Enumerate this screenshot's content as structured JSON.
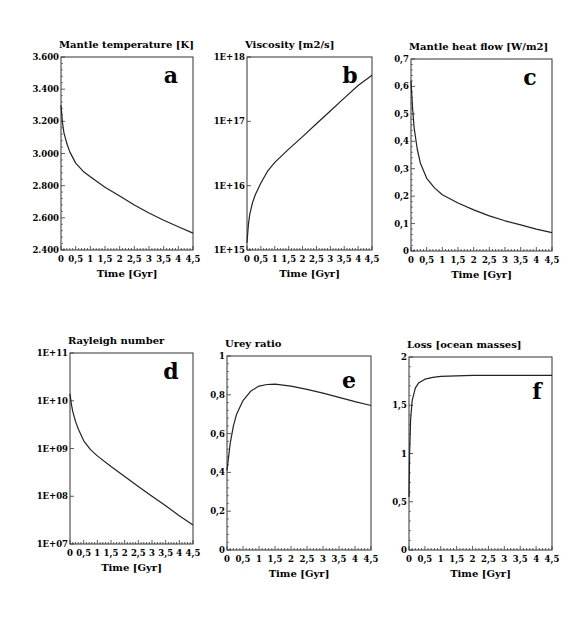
{
  "figure": {
    "x_axis_label": "Time [Gyr]",
    "x_tick_labels": [
      "0",
      "0,5",
      "1",
      "1,5",
      "2",
      "2,5",
      "3",
      "3,5",
      "4",
      "4,5"
    ]
  },
  "chart_data": [
    {
      "id": "a",
      "type": "line",
      "title": "Mantle temperature [K]",
      "panel_label": "a",
      "xlabel": "Time [Gyr]",
      "ylabel": "Mantle temperature [K]",
      "xlim": [
        0,
        4.5
      ],
      "ylim": [
        2400,
        3600
      ],
      "yscale": "linear",
      "y_tick_values": [
        2400,
        2600,
        2800,
        3000,
        3200,
        3400,
        3600
      ],
      "y_tick_labels": [
        "2.400",
        "2.600",
        "2.800",
        "3.000",
        "3.200",
        "3.400",
        "3.600"
      ],
      "grid": false,
      "frame": {
        "left": 61,
        "top": 57,
        "right": 193,
        "bottom": 250
      },
      "x": [
        0,
        0.05,
        0.1,
        0.2,
        0.3,
        0.5,
        0.75,
        1.0,
        1.5,
        2.0,
        2.5,
        3.0,
        3.5,
        4.0,
        4.5
      ],
      "y": [
        3300,
        3190,
        3130,
        3060,
        3010,
        2940,
        2890,
        2855,
        2790,
        2735,
        2680,
        2630,
        2585,
        2545,
        2505
      ]
    },
    {
      "id": "b",
      "type": "line",
      "title": "Viscosity [m2/s]",
      "panel_label": "b",
      "xlabel": "Time [Gyr]",
      "ylabel": "Viscosity [m2/s]",
      "xlim": [
        0,
        4.5
      ],
      "ylim": [
        1000000000000000.0,
        1e+18
      ],
      "yscale": "log",
      "y_tick_values": [
        1000000000000000.0,
        1e+16,
        1e+17,
        1e+18
      ],
      "y_tick_labels": [
        "1E+15",
        "1E+16",
        "1E+17",
        "1E+18"
      ],
      "grid": false,
      "frame": {
        "left": 247,
        "top": 57,
        "right": 372,
        "bottom": 250
      },
      "x": [
        0,
        0.05,
        0.1,
        0.2,
        0.3,
        0.5,
        0.75,
        1.0,
        1.5,
        2.0,
        2.5,
        3.0,
        3.5,
        4.0,
        4.5
      ],
      "y": [
        1300000000000000.0,
        2500000000000000.0,
        3600000000000000.0,
        5500000000000000.0,
        7200000000000000.0,
        1.1e+16,
        1.7e+16,
        2.3e+16,
        3.7e+16,
        5.8e+16,
        9.2e+16,
        1.45e+17,
        2.3e+17,
        3.6e+17,
        5.2e+17
      ]
    },
    {
      "id": "c",
      "type": "line",
      "title": "Mantle heat flow [W/m2]",
      "panel_label": "c",
      "xlabel": "Time [Gyr]",
      "ylabel": "Mantle heat flow [W/m2]",
      "xlim": [
        0,
        4.5
      ],
      "ylim": [
        0,
        0.7
      ],
      "yscale": "linear",
      "y_tick_values": [
        0,
        0.1,
        0.2,
        0.3,
        0.4,
        0.5,
        0.6,
        0.7
      ],
      "y_tick_labels": [
        "0",
        "0,1",
        "0,2",
        "0,3",
        "0,4",
        "0,5",
        "0,6",
        "0,7"
      ],
      "grid": false,
      "frame": {
        "left": 411,
        "top": 59,
        "right": 552,
        "bottom": 251
      },
      "x": [
        0,
        0.05,
        0.1,
        0.2,
        0.3,
        0.5,
        0.75,
        1.0,
        1.5,
        2.0,
        2.5,
        3.0,
        3.5,
        4.0,
        4.5
      ],
      "y": [
        0.62,
        0.52,
        0.45,
        0.37,
        0.32,
        0.265,
        0.23,
        0.205,
        0.175,
        0.15,
        0.128,
        0.11,
        0.095,
        0.08,
        0.067
      ]
    },
    {
      "id": "d",
      "type": "line",
      "title": "Rayleigh number",
      "panel_label": "d",
      "xlabel": "Time [Gyr]",
      "ylabel": "Rayleigh number",
      "xlim": [
        0,
        4.5
      ],
      "ylim": [
        10000000.0,
        100000000000.0
      ],
      "yscale": "log",
      "y_tick_values": [
        10000000.0,
        100000000.0,
        1000000000.0,
        10000000000.0,
        100000000000.0
      ],
      "y_tick_labels": [
        "1E+07",
        "1E+08",
        "1E+09",
        "1E+10",
        "1E+11"
      ],
      "grid": false,
      "frame": {
        "left": 70,
        "top": 353,
        "right": 193,
        "bottom": 544
      },
      "x": [
        0,
        0.05,
        0.1,
        0.2,
        0.3,
        0.5,
        0.75,
        1.0,
        1.5,
        2.0,
        2.5,
        3.0,
        3.5,
        4.0,
        4.5
      ],
      "y": [
        14000000000.0,
        8500000000.0,
        6000000000.0,
        3700000000.0,
        2600000000.0,
        1450000000.0,
        950000000.0,
        700000000.0,
        420000000.0,
        260000000.0,
        160000000.0,
        100000000.0,
        63000000.0,
        39000000.0,
        25000000.0
      ]
    },
    {
      "id": "e",
      "type": "line",
      "title": "Urey ratio",
      "panel_label": "e",
      "xlabel": "Time [Gyr]",
      "ylabel": "Urey ratio",
      "xlim": [
        0,
        4.5
      ],
      "ylim": [
        0,
        1
      ],
      "yscale": "linear",
      "y_tick_values": [
        0,
        0.2,
        0.4,
        0.6,
        0.8,
        1
      ],
      "y_tick_labels": [
        "0",
        "0,2",
        "0,4",
        "0,6",
        "0,8",
        "1"
      ],
      "grid": false,
      "frame": {
        "left": 227,
        "top": 356,
        "right": 371,
        "bottom": 550
      },
      "x": [
        0,
        0.05,
        0.1,
        0.2,
        0.3,
        0.5,
        0.75,
        1.0,
        1.25,
        1.5,
        2.0,
        2.5,
        3.0,
        3.5,
        4.0,
        4.5
      ],
      "y": [
        0.41,
        0.48,
        0.55,
        0.64,
        0.7,
        0.77,
        0.82,
        0.845,
        0.853,
        0.855,
        0.845,
        0.828,
        0.808,
        0.787,
        0.765,
        0.745
      ]
    },
    {
      "id": "f",
      "type": "line",
      "title": "Loss [ocean masses]",
      "panel_label": "f",
      "xlabel": "Time [Gyr]",
      "ylabel": "Loss [ocean masses]",
      "xlim": [
        0,
        4.5
      ],
      "ylim": [
        0,
        2
      ],
      "yscale": "linear",
      "y_tick_values": [
        0,
        0.5,
        1,
        1.5,
        2
      ],
      "y_tick_labels": [
        "0",
        "0,5",
        "1",
        "1,5",
        "2"
      ],
      "grid": false,
      "frame": {
        "left": 409,
        "top": 357,
        "right": 552,
        "bottom": 550
      },
      "x": [
        0,
        0.02,
        0.05,
        0.1,
        0.2,
        0.3,
        0.5,
        0.75,
        1.0,
        1.5,
        2.0,
        2.5,
        3.0,
        3.5,
        4.0,
        4.5
      ],
      "y": [
        0.55,
        1.0,
        1.35,
        1.55,
        1.68,
        1.73,
        1.77,
        1.79,
        1.8,
        1.805,
        1.81,
        1.81,
        1.81,
        1.81,
        1.81,
        1.81
      ]
    }
  ]
}
